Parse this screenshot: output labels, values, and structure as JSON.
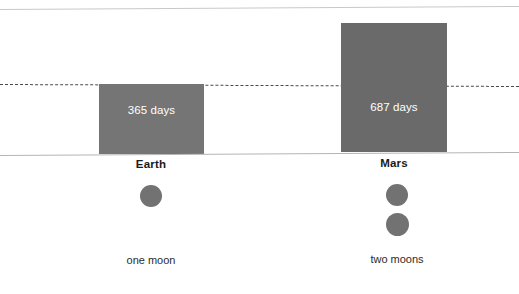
{
  "chart_data": {
    "type": "bar",
    "title": "",
    "subtitle": "",
    "xlabel": "",
    "ylabel": "",
    "grid": false,
    "legend": "none",
    "categories": [
      "Earth",
      "Mars"
    ],
    "values": [
      365,
      687
    ],
    "value_unit": "days",
    "value_labels": [
      "365 days",
      "687 days"
    ],
    "annotations": [
      {
        "name": "reference-line",
        "style": "dashed",
        "value": 365,
        "label": ""
      }
    ],
    "series": [
      {
        "name": "Orbital period (days)",
        "values": [
          365,
          687
        ]
      }
    ],
    "extra_rows": [
      {
        "name": "moons",
        "labels": [
          "one moon",
          "two moons"
        ],
        "counts": [
          1,
          2
        ]
      }
    ]
  },
  "figure": {
    "bars": [
      {
        "id": "earth",
        "category": "Earth",
        "value_label": "365 days",
        "color": "#757575",
        "label_color": "#ffffff"
      },
      {
        "id": "mars",
        "category": "Mars",
        "value_label": "687 days",
        "color": "#6a6a6a",
        "label_color": "#ffffff"
      }
    ],
    "moons": {
      "earth_caption": "one moon",
      "mars_caption": "two moons",
      "moon_color": "#727272"
    },
    "lines": {
      "top_rule_color": "#c9c9c9",
      "baseline_color": "#b5b5b5",
      "dashed_reference_color": "#4a4a4a"
    }
  }
}
